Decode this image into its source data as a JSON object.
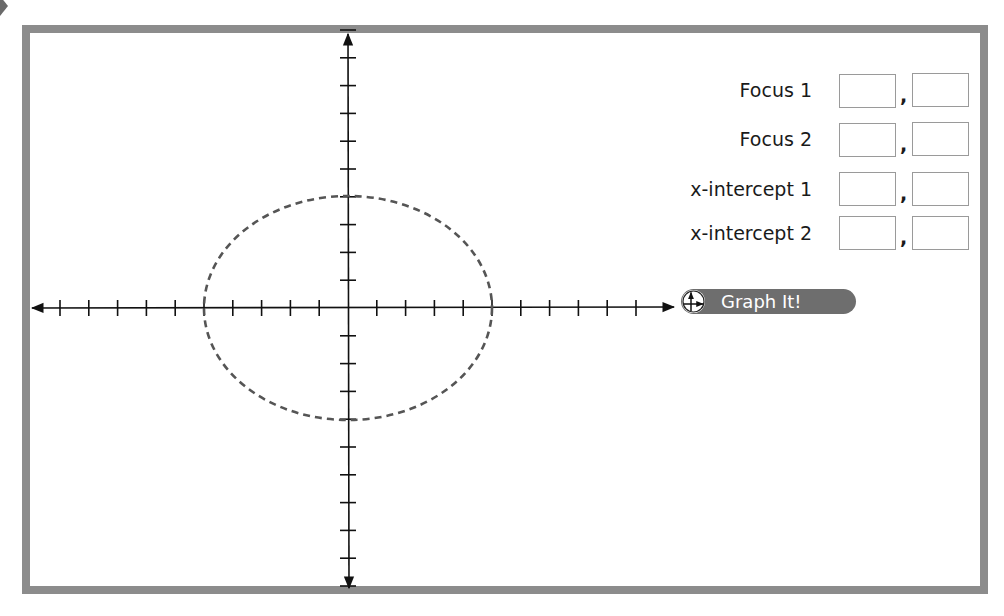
{
  "form": {
    "rows": [
      {
        "label": "Focus 1",
        "x_value": "",
        "y_value": "",
        "separator": ","
      },
      {
        "label": "Focus 2",
        "x_value": "",
        "y_value": "",
        "separator": ","
      },
      {
        "label": "x-intercept 1",
        "x_value": "",
        "y_value": "",
        "separator": ","
      },
      {
        "label": "x-intercept 2",
        "x_value": "",
        "y_value": "",
        "separator": ","
      }
    ]
  },
  "graph_button": {
    "label": "Graph It!",
    "icon": "axes-icon"
  },
  "graph": {
    "x_ticks_each_side": 10,
    "y_ticks_each_side": 10,
    "ellipse": {
      "center": [
        0,
        0
      ],
      "semi_major_x": 5,
      "semi_minor_y": 4,
      "style": "dashed"
    }
  },
  "colors": {
    "frame": "#8c8c8c",
    "button": "#6e6e6e",
    "curve": "#555555",
    "axis": "#111111"
  }
}
